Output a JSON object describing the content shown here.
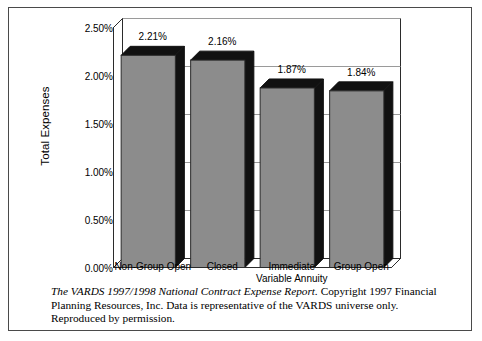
{
  "chart_data": {
    "type": "bar",
    "title": "",
    "subtitle": "",
    "xlabel": "",
    "ylabel": "Total Expenses",
    "categories": [
      "Non-Group Open",
      "Closed",
      "Immediate Variable Annuity",
      "Group Open"
    ],
    "category_lines": [
      [
        "Non-Group Open"
      ],
      [
        "Closed"
      ],
      [
        "Immediate",
        "Variable Annuity"
      ],
      [
        "Group Open"
      ]
    ],
    "values": [
      2.21,
      2.16,
      1.87,
      1.84
    ],
    "value_labels": [
      "2.21%",
      "2.16%",
      "1.87%",
      "1.84%"
    ],
    "ylim": [
      0,
      2.5
    ],
    "ytick_values": [
      0.0,
      0.5,
      1.0,
      1.5,
      2.0,
      2.5
    ],
    "ytick_labels": [
      "0.00%",
      "0.50%",
      "1.00%",
      "1.50%",
      "2.00%",
      "2.50%"
    ],
    "grid": true,
    "grid_axis": "y",
    "legend": false,
    "legend_position": "none",
    "style": "3d-column",
    "colors": {
      "bar_face": "#8c8c8c",
      "bar_top": "#111111",
      "bar_side": "#111111",
      "grid_line": "#9a9a9a",
      "axis_line": "#2b2b2b",
      "plot_background": "#ffffff",
      "text": "#000000",
      "frame_border": "#4a4a4a"
    }
  },
  "caption": {
    "source_title": "The VARDS 1997/1998 National Contract Expense Report.",
    "body": " Copyright 1997 Financial Planning Resources, Inc. Data is representative of the VARDS universe only. Reproduced by permission."
  }
}
